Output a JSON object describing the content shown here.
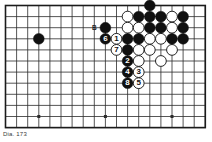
{
  "figure": {
    "caption": "Dia. 173",
    "board": {
      "type": "go-board-diagram",
      "cols": 19,
      "rows": 12,
      "left": 5.5,
      "top": 5.5,
      "spacing": 11.1,
      "visible_cols": 19,
      "visible_rows": 12,
      "line_color": "#2b2b2b",
      "border_color": "#1b1b1b",
      "background": "#ffffff",
      "stone_radius": 5.4,
      "black_color": "#101010",
      "white_color": "#ffffff",
      "white_edge": "#101010"
    },
    "hoshi": [
      {
        "col": 3,
        "row": 10
      },
      {
        "col": 9,
        "row": 10
      },
      {
        "col": 15,
        "row": 10
      },
      {
        "col": 9,
        "row": 3
      },
      {
        "col": 15,
        "row": 3
      }
    ],
    "markers": [
      {
        "name": "point-b",
        "label": "B",
        "col": 8,
        "row": 2,
        "color": "#222222"
      }
    ],
    "stones": [
      {
        "color": "black",
        "col": 3,
        "row": 3,
        "label": ""
      },
      {
        "color": "black",
        "col": 9,
        "row": 2,
        "label": ""
      },
      {
        "color": "black",
        "col": 9,
        "row": 3,
        "label": "6",
        "move": 6
      },
      {
        "color": "white",
        "col": 10,
        "row": 3,
        "label": "1",
        "move": 1
      },
      {
        "color": "white",
        "col": 10,
        "row": 4,
        "label": "7",
        "move": 7
      },
      {
        "color": "white",
        "col": 11,
        "row": 1,
        "label": ""
      },
      {
        "color": "white",
        "col": 11,
        "row": 2,
        "label": ""
      },
      {
        "color": "black",
        "col": 12,
        "row": 1,
        "label": ""
      },
      {
        "color": "white",
        "col": 12,
        "row": 2,
        "label": ""
      },
      {
        "color": "black",
        "col": 11,
        "row": 3,
        "label": ""
      },
      {
        "color": "black",
        "col": 11,
        "row": 4,
        "label": ""
      },
      {
        "color": "black",
        "col": 12,
        "row": 3,
        "label": ""
      },
      {
        "color": "white",
        "col": 12,
        "row": 4,
        "label": ""
      },
      {
        "color": "black",
        "col": 13,
        "row": 0,
        "label": ""
      },
      {
        "color": "black",
        "col": 13,
        "row": 1,
        "label": ""
      },
      {
        "color": "black",
        "col": 13,
        "row": 2,
        "label": ""
      },
      {
        "color": "white",
        "col": 13,
        "row": 3,
        "label": ""
      },
      {
        "color": "white",
        "col": 13,
        "row": 4,
        "label": ""
      },
      {
        "color": "black",
        "col": 14,
        "row": 1,
        "label": ""
      },
      {
        "color": "black",
        "col": 14,
        "row": 2,
        "label": ""
      },
      {
        "color": "white",
        "col": 14,
        "row": 3,
        "label": ""
      },
      {
        "color": "white",
        "col": 15,
        "row": 1,
        "label": ""
      },
      {
        "color": "white",
        "col": 15,
        "row": 2,
        "label": ""
      },
      {
        "color": "black",
        "col": 15,
        "row": 3,
        "label": ""
      },
      {
        "color": "white",
        "col": 15,
        "row": 4,
        "label": ""
      },
      {
        "color": "black",
        "col": 16,
        "row": 1,
        "label": ""
      },
      {
        "color": "black",
        "col": 16,
        "row": 2,
        "label": ""
      },
      {
        "color": "black",
        "col": 16,
        "row": 3,
        "label": ""
      },
      {
        "color": "black",
        "col": 11,
        "row": 5,
        "label": "2",
        "move": 2
      },
      {
        "color": "white",
        "col": 12,
        "row": 5,
        "label": ""
      },
      {
        "color": "black",
        "col": 11,
        "row": 6,
        "label": "4",
        "move": 4
      },
      {
        "color": "white",
        "col": 12,
        "row": 6,
        "label": "3",
        "move": 3
      },
      {
        "color": "black",
        "col": 11,
        "row": 7,
        "label": "8",
        "move": 8
      },
      {
        "color": "white",
        "col": 12,
        "row": 7,
        "label": "5",
        "move": 5
      },
      {
        "color": "white",
        "col": 14,
        "row": 5,
        "label": ""
      }
    ]
  }
}
